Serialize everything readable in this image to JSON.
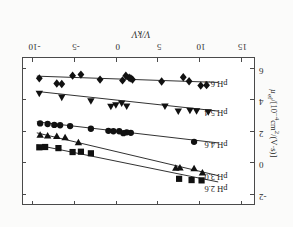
{
  "figure": {
    "orientation": "rotated-180",
    "axis_color": "#4a4a4a",
    "marker_color": "#111111"
  },
  "chart_data": {
    "type": "scatter",
    "title": "",
    "xlabel": "V/kV",
    "ylabel": "µef/[10⁻⁴cm²/(V·s)]",
    "xlim": [
      16.5,
      -11.5
    ],
    "ylim": [
      -2.6,
      6.8
    ],
    "xticks": [
      15,
      10,
      5,
      0,
      -5,
      -10
    ],
    "xticklabels": [
      "15",
      "10",
      "5",
      "0",
      "-5",
      "-10"
    ],
    "yticks": [
      -2,
      0,
      2,
      4,
      6
    ],
    "yticklabels": [
      "-2",
      "0",
      "2",
      "4",
      "6"
    ],
    "grid": false,
    "legend_position": "inline-left-of-series",
    "series": [
      {
        "name": "pH 2.6",
        "label": "pH 2.6",
        "marker": "square",
        "label_x": 13.2,
        "label_y": -1.55,
        "fit_line": [
          [
            12.2,
            -1.2
          ],
          [
            -9.6,
            1.15
          ]
        ],
        "points": [
          [
            10.2,
            -1.1
          ],
          [
            9.0,
            -1.08
          ],
          [
            7.5,
            -1.0
          ],
          [
            -3.1,
            0.62
          ],
          [
            -4.3,
            0.72
          ],
          [
            -5.3,
            0.7
          ],
          [
            -7.0,
            0.95
          ],
          [
            -8.6,
            1.02
          ],
          [
            -9.3,
            1.0
          ]
        ]
      },
      {
        "name": "pH 3.0",
        "label": "pH 3.0",
        "marker": "triangle-down",
        "label_x": 13.2,
        "label_y": -0.75,
        "fit_line": [
          [
            12.2,
            -0.8
          ],
          [
            -9.6,
            1.92
          ]
        ],
        "points": [
          [
            10.3,
            -0.62
          ],
          [
            9.3,
            -0.35
          ],
          [
            7.6,
            -0.3
          ],
          [
            7.1,
            -0.32
          ],
          [
            -4.6,
            1.3
          ],
          [
            -6.2,
            1.62
          ],
          [
            -7.2,
            1.7
          ],
          [
            -8.3,
            1.72
          ],
          [
            -9.2,
            1.78
          ]
        ]
      },
      {
        "name": "pH 4.6",
        "label": "pH 4.6",
        "marker": "circle",
        "label_x": 13.2,
        "label_y": 1.28,
        "fit_line": [
          [
            12.2,
            1.28
          ],
          [
            -9.6,
            2.62
          ]
        ],
        "points": [
          [
            9.3,
            1.35
          ],
          [
            1.7,
            1.92
          ],
          [
            1.2,
            1.95
          ],
          [
            0.8,
            1.9
          ],
          [
            0.3,
            2.02
          ],
          [
            -0.4,
            2.02
          ],
          [
            -1.0,
            2.05
          ],
          [
            -3.1,
            2.18
          ],
          [
            -5.6,
            2.35
          ],
          [
            -6.8,
            2.4
          ],
          [
            -7.5,
            2.42
          ],
          [
            -8.3,
            2.48
          ],
          [
            -9.2,
            2.52
          ]
        ]
      },
      {
        "name": "pH 5.4",
        "label": "pH 5.4",
        "marker": "triangle-up",
        "label_x": 13.2,
        "label_y": 3.32,
        "fit_line": [
          [
            12.2,
            3.3
          ],
          [
            -9.6,
            4.55
          ]
        ],
        "points": [
          [
            11.0,
            3.25
          ],
          [
            9.6,
            3.32
          ],
          [
            8.8,
            3.35
          ],
          [
            7.4,
            3.3
          ],
          [
            5.8,
            3.62
          ],
          [
            1.2,
            3.62
          ],
          [
            0.6,
            3.8
          ],
          [
            -0.1,
            3.7
          ],
          [
            -0.7,
            3.6
          ],
          [
            -3.1,
            3.95
          ],
          [
            -6.6,
            4.18
          ],
          [
            -9.3,
            4.42
          ]
        ]
      },
      {
        "name": "pH 6.3",
        "label": "pH 6.3",
        "marker": "diamond",
        "label_x": 13.2,
        "label_y": 5.12,
        "fit_line": [
          [
            12.2,
            5.12
          ],
          [
            -9.6,
            5.52
          ]
        ],
        "points": [
          [
            10.8,
            4.95
          ],
          [
            10.1,
            4.92
          ],
          [
            8.7,
            5.2
          ],
          [
            8.0,
            5.45
          ],
          [
            5.4,
            5.18
          ],
          [
            1.9,
            5.3
          ],
          [
            1.7,
            5.38
          ],
          [
            1.5,
            5.42
          ],
          [
            1.1,
            5.55
          ],
          [
            0.7,
            5.25
          ],
          [
            -2.0,
            5.3
          ],
          [
            -4.3,
            5.62
          ],
          [
            -5.3,
            5.55
          ],
          [
            -6.6,
            5.02
          ],
          [
            -7.2,
            5.05
          ],
          [
            -9.3,
            5.38
          ]
        ]
      }
    ]
  }
}
